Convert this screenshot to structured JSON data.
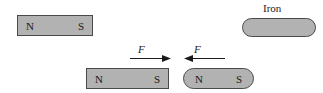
{
  "figure": {
    "colors": {
      "magnet_fill": "#b2b2b2",
      "outline": "#4a4a4a",
      "text": "#1a1a1a",
      "background": "#ffffff"
    }
  },
  "top_magnet": {
    "name": "bar magnet",
    "north_label": "N",
    "south_label": "S"
  },
  "iron": {
    "caption": "Iron"
  },
  "bottom_left_magnet": {
    "name": "bar magnet",
    "north_label": "N",
    "south_label": "S"
  },
  "bottom_right_magnet": {
    "name": "rounded magnet",
    "north_label": "N",
    "south_label": "S"
  },
  "forces": {
    "left": {
      "label": "F",
      "direction": "right"
    },
    "right": {
      "label": "F",
      "direction": "left"
    }
  }
}
